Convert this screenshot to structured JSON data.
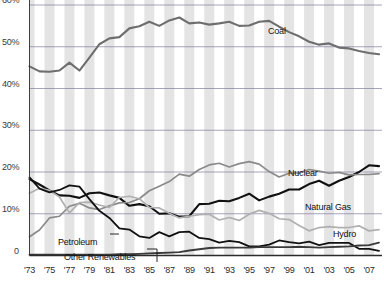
{
  "chart_data": {
    "type": "line",
    "title": "",
    "xlabel": "",
    "ylabel": "",
    "xlim": [
      1973,
      2008
    ],
    "ylim": [
      0,
      60
    ],
    "grid": true,
    "legend_position": "inline-labels",
    "y_ticks": [
      "0",
      "10%",
      "20%",
      "30%",
      "40%",
      "50%",
      "60%"
    ],
    "y_tick_values": [
      0,
      10,
      20,
      30,
      40,
      50,
      60
    ],
    "x_ticks": [
      "'73",
      "'75",
      "'77",
      "'79",
      "'81",
      "'83",
      "'85",
      "'87",
      "'89",
      "'91",
      "'93",
      "'95",
      "'97",
      "'99",
      "'01",
      "'03",
      "'05",
      "'07"
    ],
    "x_tick_values": [
      1973,
      1975,
      1977,
      1979,
      1981,
      1983,
      1985,
      1987,
      1989,
      1991,
      1993,
      1995,
      1997,
      1999,
      2001,
      2003,
      2005,
      2007
    ],
    "x": [
      1973,
      1974,
      1975,
      1976,
      1977,
      1978,
      1979,
      1980,
      1981,
      1982,
      1983,
      1984,
      1985,
      1986,
      1987,
      1988,
      1989,
      1990,
      1991,
      1992,
      1993,
      1994,
      1995,
      1996,
      1997,
      1998,
      1999,
      2000,
      2001,
      2002,
      2003,
      2004,
      2005,
      2006,
      2007,
      2008
    ],
    "series": [
      {
        "name": "Coal",
        "color": "#6e6e6e",
        "width": 2.1,
        "values": [
          45.3,
          44.1,
          44.0,
          44.3,
          46.2,
          44.3,
          47.4,
          50.6,
          52.0,
          52.3,
          54.4,
          54.9,
          56.0,
          55.0,
          56.3,
          57.0,
          55.6,
          55.8,
          55.3,
          55.6,
          56.0,
          55.0,
          55.1,
          56.0,
          56.2,
          54.8,
          53.5,
          52.5,
          51.2,
          50.5,
          50.8,
          49.8,
          49.6,
          49.0,
          48.5,
          48.2
        ]
      },
      {
        "name": "Natural Gas",
        "color": "#111111",
        "width": 2.1,
        "values": [
          18.3,
          17.0,
          15.6,
          14.4,
          14.3,
          13.8,
          14.9,
          15.1,
          14.4,
          13.8,
          11.9,
          12.3,
          11.8,
          10.0,
          10.1,
          9.3,
          9.4,
          12.3,
          12.4,
          13.1,
          13.0,
          13.8,
          14.8,
          13.2,
          14.1,
          14.8,
          15.8,
          15.8,
          17.1,
          17.9,
          16.7,
          17.9,
          18.8,
          20.0,
          21.6,
          21.4
        ]
      },
      {
        "name": "Nuclear",
        "color": "#8a8a8a",
        "width": 1.7,
        "values": [
          4.5,
          6.1,
          9.0,
          9.4,
          11.8,
          12.5,
          11.4,
          11.0,
          11.9,
          12.6,
          12.7,
          13.6,
          15.5,
          16.6,
          17.7,
          19.5,
          19.0,
          20.6,
          21.7,
          22.1,
          21.2,
          22.0,
          22.5,
          21.9,
          20.1,
          18.8,
          19.7,
          19.8,
          20.6,
          20.2,
          19.7,
          19.9,
          19.3,
          19.4,
          19.4,
          19.6
        ]
      },
      {
        "name": "Hydro",
        "color": "#b0b0b0",
        "width": 1.7,
        "values": [
          14.9,
          16.1,
          15.6,
          14.0,
          10.2,
          12.7,
          12.8,
          12.1,
          11.5,
          13.9,
          14.2,
          13.6,
          11.5,
          11.4,
          10.1,
          9.0,
          9.4,
          9.8,
          9.9,
          8.5,
          9.1,
          8.4,
          9.9,
          10.8,
          10.1,
          8.8,
          8.6,
          7.2,
          5.9,
          6.7,
          6.9,
          6.7,
          6.7,
          7.1,
          5.9,
          6.2
        ]
      },
      {
        "name": "Petroleum",
        "color": "#111111",
        "width": 1.8,
        "values": [
          18.7,
          16.0,
          15.1,
          15.7,
          16.8,
          16.5,
          13.5,
          10.7,
          9.0,
          6.5,
          6.2,
          4.6,
          4.2,
          5.6,
          4.6,
          5.6,
          5.7,
          4.2,
          3.9,
          3.1,
          3.5,
          3.2,
          2.2,
          2.2,
          2.6,
          3.6,
          3.2,
          2.9,
          3.3,
          2.5,
          3.0,
          3.0,
          3.0,
          1.6,
          1.6,
          1.1
        ]
      },
      {
        "name": "Other Renewables",
        "color": "#3a3a3a",
        "width": 1.8,
        "values": [
          0.2,
          0.2,
          0.2,
          0.2,
          0.2,
          0.2,
          0.2,
          0.2,
          0.2,
          0.3,
          0.3,
          0.4,
          0.5,
          0.6,
          0.7,
          0.8,
          1.2,
          1.5,
          1.8,
          1.9,
          1.9,
          1.9,
          1.9,
          2.0,
          2.0,
          2.0,
          2.0,
          2.1,
          2.0,
          1.9,
          2.0,
          2.1,
          2.2,
          2.4,
          2.5,
          3.1
        ]
      }
    ],
    "annotations": [
      {
        "name": "coal-label",
        "text": "Coal",
        "x": 268,
        "y": 26,
        "leader": false
      },
      {
        "name": "nuclear-label",
        "text": "Nuclear",
        "x": 288,
        "y": 168,
        "leader": false
      },
      {
        "name": "natural-gas-label",
        "text": "Natural Gas",
        "x": 305,
        "y": 202,
        "leader": false
      },
      {
        "name": "hydro-label",
        "text": "Hydro",
        "x": 333,
        "y": 229,
        "leader": false
      },
      {
        "name": "petroleum-label",
        "text": "Petroleum",
        "x": 58,
        "y": 237,
        "leader": true
      },
      {
        "name": "other-renewables-label",
        "text": "Other Renewables",
        "x": 64,
        "y": 252,
        "leader": true
      }
    ],
    "band_color": "#dcdcdc",
    "gridline_color": "#7a7a9a",
    "axis_color": "#2b2b2b",
    "background": "#ffffff"
  }
}
